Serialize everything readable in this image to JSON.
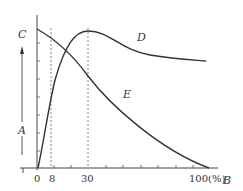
{
  "diagram": {
    "axes": {
      "y_label_top": "C",
      "y_label_mid": "A",
      "x_label": "B",
      "x_ticks": [
        {
          "label": "0",
          "value": 0
        },
        {
          "label": "8",
          "value": 8
        },
        {
          "label": "30",
          "value": 30
        },
        {
          "label": "100(%)",
          "value": 100
        }
      ]
    },
    "curves": [
      {
        "name": "D",
        "description": "rises steeply from 0, peaks at 30, then slowly declines"
      },
      {
        "name": "E",
        "description": "monotonically decreasing from top-left to 0 at 100%"
      }
    ],
    "reference_lines": [
      {
        "at": 8,
        "style": "dashed"
      },
      {
        "at": 30,
        "style": "dashed"
      }
    ],
    "colors": {
      "line": "#333333",
      "dashed": "#666666",
      "background": "#ffffff"
    }
  }
}
